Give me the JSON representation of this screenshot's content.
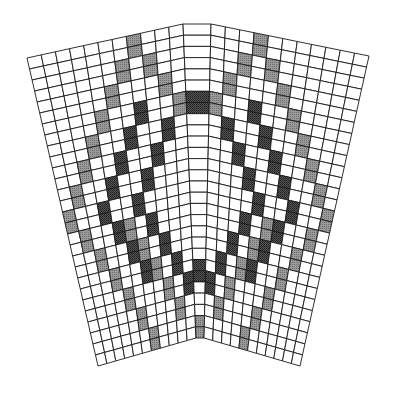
{
  "diagram": {
    "type": "knitting-chart-mesh",
    "colors": {
      "grid_line": "#1a1a1a",
      "empty_cell": "#ffffff",
      "light_shade": "#8a8a8a",
      "dark_shade": "#3a3a3a"
    },
    "rows": 28,
    "panels": [
      {
        "name": "left-panel",
        "cols": 11,
        "corners": {
          "tl": [
            27,
            58
          ],
          "tr": [
            183,
            24
          ],
          "br": [
            196,
            338
          ],
          "bl": [
            98,
            366
          ]
        }
      },
      {
        "name": "center-wedge",
        "cols": 1,
        "corners": {
          "tl": [
            183,
            24
          ],
          "tr": [
            211,
            24
          ],
          "br": [
            204,
            338
          ],
          "bl": [
            196,
            338
          ]
        }
      },
      {
        "name": "right-panel",
        "cols": 11,
        "corners": {
          "tl": [
            211,
            24
          ],
          "tr": [
            369,
            56
          ],
          "br": [
            300,
            366
          ],
          "bl": [
            204,
            338
          ]
        }
      }
    ],
    "shaded_left": {
      "light": [
        [
          7,
          0
        ],
        [
          7,
          1
        ],
        [
          6,
          2
        ],
        [
          6,
          3
        ],
        [
          8,
          2
        ],
        [
          8,
          3
        ],
        [
          5,
          4
        ],
        [
          5,
          5
        ],
        [
          9,
          4
        ],
        [
          9,
          5
        ],
        [
          4,
          6
        ],
        [
          4,
          7
        ],
        [
          10,
          6
        ],
        [
          10,
          7
        ],
        [
          3,
          8
        ],
        [
          3,
          9
        ],
        [
          2,
          10
        ],
        [
          2,
          11
        ],
        [
          1,
          12
        ],
        [
          1,
          13
        ],
        [
          0,
          14
        ],
        [
          0,
          15
        ],
        [
          1,
          16
        ],
        [
          1,
          17
        ],
        [
          2,
          18
        ],
        [
          2,
          19
        ],
        [
          3,
          20
        ],
        [
          3,
          21
        ],
        [
          4,
          22
        ],
        [
          4,
          23
        ],
        [
          5,
          24
        ],
        [
          5,
          25
        ],
        [
          6,
          26
        ],
        [
          6,
          27
        ],
        [
          5,
          16
        ],
        [
          5,
          17
        ],
        [
          6,
          18
        ],
        [
          6,
          19
        ],
        [
          7,
          20
        ],
        [
          7,
          21
        ],
        [
          8,
          22
        ],
        [
          8,
          23
        ],
        [
          9,
          24
        ],
        [
          9,
          25
        ]
      ],
      "dark": [
        [
          7,
          6
        ],
        [
          7,
          7
        ],
        [
          6,
          8
        ],
        [
          6,
          9
        ],
        [
          9,
          8
        ],
        [
          9,
          9
        ],
        [
          5,
          10
        ],
        [
          5,
          11
        ],
        [
          8,
          10
        ],
        [
          8,
          11
        ],
        [
          4,
          12
        ],
        [
          4,
          13
        ],
        [
          7,
          12
        ],
        [
          7,
          13
        ],
        [
          3,
          14
        ],
        [
          3,
          15
        ],
        [
          6,
          14
        ],
        [
          6,
          15
        ],
        [
          4,
          16
        ],
        [
          4,
          17
        ],
        [
          7,
          16
        ],
        [
          7,
          17
        ],
        [
          5,
          18
        ],
        [
          5,
          19
        ],
        [
          8,
          18
        ],
        [
          8,
          19
        ],
        [
          6,
          20
        ],
        [
          6,
          21
        ],
        [
          9,
          20
        ],
        [
          9,
          21
        ],
        [
          10,
          22
        ],
        [
          10,
          23
        ]
      ]
    },
    "shaded_wedge": {
      "light": [
        [
          0,
          26
        ],
        [
          0,
          27
        ]
      ],
      "dark": [
        [
          0,
          6
        ],
        [
          0,
          7
        ],
        [
          0,
          21
        ],
        [
          0,
          22
        ]
      ]
    }
  }
}
